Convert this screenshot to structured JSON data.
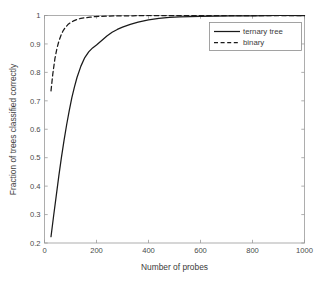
{
  "chart_data": {
    "type": "line",
    "title": "",
    "xlabel": "Number of probes",
    "ylabel": "Fraction of trees classified correctly",
    "xlim": [
      0,
      1000
    ],
    "ylim": [
      0.2,
      1.0
    ],
    "grid": false,
    "legend_position": "upper right",
    "xticks": [
      0,
      200,
      400,
      600,
      800,
      1000
    ],
    "xtick_labels": [
      "0",
      "200",
      "400",
      "600",
      "800",
      "1000"
    ],
    "yticks": [
      0.2,
      0.3,
      0.4,
      0.5,
      0.6,
      0.7,
      0.8,
      0.9,
      1.0
    ],
    "ytick_labels": [
      "0.2",
      "0.3",
      "0.4",
      "0.5",
      "0.6",
      "0.7",
      "0.8",
      "0.9",
      "1"
    ],
    "series": [
      {
        "name": "ternary tree",
        "style": "solid",
        "color": "#1a1a1a",
        "x": [
          25,
          35,
          45,
          55,
          65,
          75,
          85,
          95,
          105,
          115,
          125,
          140,
          155,
          170,
          185,
          200,
          220,
          240,
          260,
          280,
          300,
          330,
          360,
          400,
          440,
          480,
          520,
          560,
          600,
          660,
          720,
          800,
          900,
          1000
        ],
        "y": [
          0.222,
          0.295,
          0.365,
          0.435,
          0.5,
          0.56,
          0.615,
          0.665,
          0.71,
          0.748,
          0.782,
          0.822,
          0.852,
          0.872,
          0.886,
          0.896,
          0.912,
          0.928,
          0.941,
          0.951,
          0.959,
          0.969,
          0.977,
          0.985,
          0.99,
          0.993,
          0.995,
          0.996,
          0.997,
          0.998,
          0.999,
          0.999,
          1.0,
          1.0
        ]
      },
      {
        "name": "binary",
        "style": "dashed",
        "color": "#1a1a1a",
        "x": [
          25,
          32,
          40,
          48,
          56,
          64,
          72,
          80,
          90,
          100,
          112,
          125,
          140,
          155,
          175,
          195,
          220,
          250,
          290,
          340,
          400,
          470,
          550,
          650,
          760,
          880,
          1000
        ],
        "y": [
          0.735,
          0.795,
          0.848,
          0.885,
          0.912,
          0.932,
          0.947,
          0.958,
          0.968,
          0.975,
          0.981,
          0.986,
          0.99,
          0.992,
          0.994,
          0.996,
          0.997,
          0.998,
          0.999,
          0.999,
          1.0,
          1.0,
          1.0,
          1.0,
          1.0,
          1.0,
          1.0
        ]
      }
    ],
    "legend_entries": [
      "ternary tree",
      "binary"
    ]
  }
}
